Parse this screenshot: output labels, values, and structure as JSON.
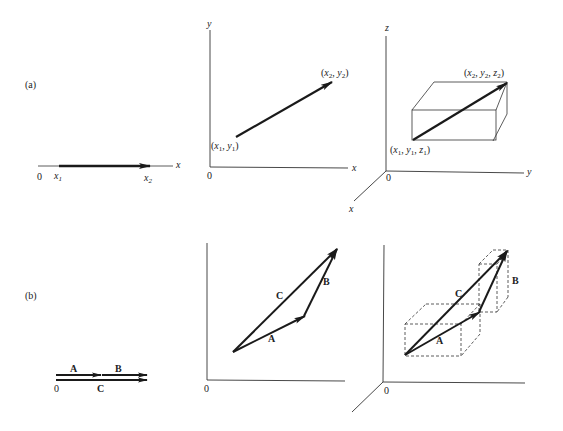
{
  "figure": {
    "panel_a": {
      "label": "(a)",
      "one_d": {
        "origin": "0",
        "axis": "x",
        "start": {
          "var": "x",
          "sub": "1"
        },
        "end": {
          "var": "x",
          "sub": "2"
        }
      },
      "two_d": {
        "origin": "0",
        "x_axis": "x",
        "y_axis": "y",
        "start_label": {
          "open": "(",
          "a": "x",
          "a_sub": "1",
          "sep": ", ",
          "b": "y",
          "b_sub": "1",
          "close": ")"
        },
        "end_label": {
          "open": "(",
          "a": "x",
          "a_sub": "2",
          "sep": ", ",
          "b": "y",
          "b_sub": "2",
          "close": ")"
        }
      },
      "three_d": {
        "origin": "0",
        "x_axis": "x",
        "y_axis": "y",
        "z_axis": "z",
        "start_label": {
          "open": "(",
          "a": "x",
          "a_sub": "1",
          "sep": ", ",
          "b": "y",
          "b_sub": "1",
          "c": "z",
          "c_sub": "1",
          "close": ")"
        },
        "end_label": {
          "open": "(",
          "a": "x",
          "a_sub": "2",
          "sep": ", ",
          "b": "y",
          "b_sub": "2",
          "c": "z",
          "c_sub": "2",
          "close": ")"
        }
      }
    },
    "panel_b": {
      "label": "(b)",
      "one_d": {
        "origin": "0",
        "vec_a": "A",
        "vec_b": "B",
        "vec_c": "C"
      },
      "two_d": {
        "origin": "0",
        "vec_a": "A",
        "vec_b": "B",
        "vec_c": "C"
      },
      "three_d": {
        "origin": "0",
        "vec_a": "A",
        "vec_b": "B",
        "vec_c": "C"
      }
    },
    "colors": {
      "ink": "#1a1a1a",
      "background": "#ffffff"
    }
  }
}
